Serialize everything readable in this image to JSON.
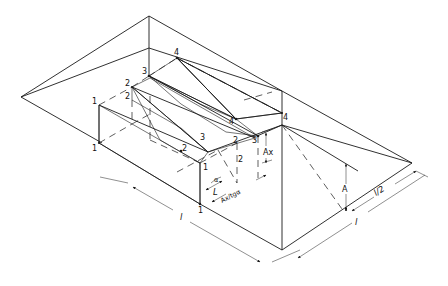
{
  "diagram": {
    "type": "isometric-technical-drawing",
    "point_labels": {
      "p1a": "1",
      "p1b": "1",
      "p1c": "1",
      "p1d": "1",
      "p2a": "2",
      "p2b": "2",
      "p2c": "2",
      "p2d": "2",
      "p2e": "2",
      "p3a": "3",
      "p3b": "3",
      "p3c": "3",
      "p4a": "4",
      "p4b": "4",
      "p4c": "4"
    },
    "dimensions": {
      "length_l": "l",
      "width_l": "l",
      "half_width": "l/2",
      "height_A": "A",
      "height_Ax": "Ax",
      "offset_L": "L",
      "angle_alpha": "α",
      "ratio": "Ax/tgα"
    },
    "colors": {
      "line": "#1a1a1a",
      "background": "#ffffff",
      "hatch": "#1a1a1a"
    }
  }
}
